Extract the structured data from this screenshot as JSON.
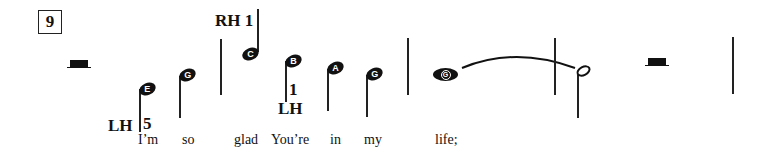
{
  "measure_number": "9",
  "fingerings": {
    "lh_start": {
      "hand": "LH",
      "finger": "5"
    },
    "rh": {
      "text": "RH 1"
    },
    "lh_second": {
      "finger": "1",
      "hand": "LH"
    }
  },
  "notes": [
    {
      "letter": "E",
      "type": "quarter"
    },
    {
      "letter": "G",
      "type": "quarter"
    },
    {
      "letter": "C",
      "type": "quarter"
    },
    {
      "letter": "B",
      "type": "quarter"
    },
    {
      "letter": "A",
      "type": "quarter"
    },
    {
      "letter": "G",
      "type": "quarter"
    },
    {
      "letter": "G",
      "type": "whole-tied"
    },
    {
      "letter": "",
      "type": "half"
    }
  ],
  "lyrics": [
    "I’m",
    "so",
    "glad",
    "You’re",
    "in",
    "my",
    "life;"
  ]
}
